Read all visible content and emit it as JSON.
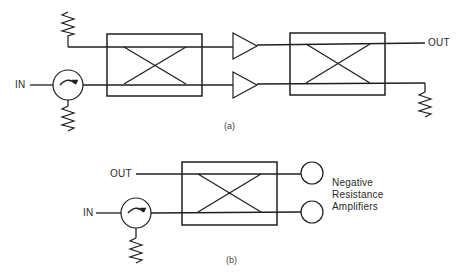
{
  "figure": {
    "panel_a": {
      "caption": "(a)",
      "input_label": "IN",
      "output_label": "OUT",
      "components": [
        {
          "type": "termination-resistor",
          "position": "top-left"
        },
        {
          "type": "circulator",
          "position": "input"
        },
        {
          "type": "termination-resistor",
          "position": "circulator-port"
        },
        {
          "type": "hybrid-coupler",
          "position": "input-side"
        },
        {
          "type": "amplifier",
          "position": "upper-branch"
        },
        {
          "type": "amplifier",
          "position": "lower-branch"
        },
        {
          "type": "hybrid-coupler",
          "position": "output-side"
        },
        {
          "type": "termination-resistor",
          "position": "bottom-right"
        }
      ]
    },
    "panel_b": {
      "caption": "(b)",
      "input_label": "IN",
      "output_label": "OUT",
      "amplifier_label_lines": [
        "Negative",
        "Resistance",
        "Amplifiers"
      ],
      "components": [
        {
          "type": "circulator",
          "position": "input"
        },
        {
          "type": "termination-resistor",
          "position": "circulator-port"
        },
        {
          "type": "hybrid-coupler",
          "position": "center"
        },
        {
          "type": "negative-resistance-amplifier",
          "position": "upper-port"
        },
        {
          "type": "negative-resistance-amplifier",
          "position": "lower-port"
        }
      ]
    }
  }
}
